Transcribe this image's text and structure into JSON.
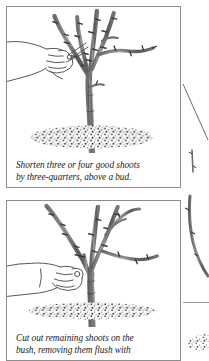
{
  "page": {
    "background_color": "#ffffff",
    "ink_color": "#4a4a4a",
    "border_color": "#8d8d8d",
    "text_color": "#1b1b1b"
  },
  "panels": [
    {
      "id": "panel-1",
      "illustration_name": "pruning-shears-cutting-shoot-illustration",
      "illustration_description": "Line drawing of a hand holding pruning shears cutting a rose bush shoot above a bud, bush rooted in stippled mulch",
      "caption": {
        "line1": "Shorten three or four good shoots",
        "line2": "by three-quarters, above a bud."
      }
    },
    {
      "id": "panel-2",
      "illustration_name": "hand-removing-shoot-at-base-illustration",
      "illustration_description": "Line drawing of a hand reaching to the base of a rose bush to cut out a remaining shoot flush with the stem at soil level",
      "caption": {
        "line1": "Cut out remaining shoots on the",
        "line2": "bush, removing them flush with"
      }
    }
  ],
  "gutter": {
    "name": "adjacent-column-fragment",
    "description": "Partial edge of the neighbouring page column showing a diagonal rule, thorny stem fragments and a patch of stippled soil"
  }
}
